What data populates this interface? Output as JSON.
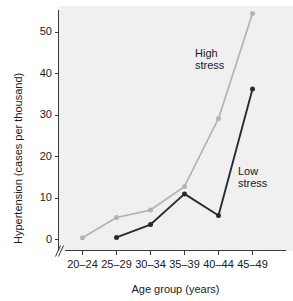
{
  "chart_data": {
    "type": "line",
    "title": "",
    "xlabel": "Age group (years)",
    "ylabel": "Hypertension (cases per thousand)",
    "categories": [
      "20–24",
      "25–29",
      "30–34",
      "35–39",
      "40–44",
      "45–49"
    ],
    "yticks": [
      0,
      10,
      20,
      30,
      40,
      50
    ],
    "ylim": [
      0,
      55
    ],
    "grid": false,
    "legend_position": "inline-annotations",
    "axis_break_x": true,
    "plot_background": "#f0f0f0",
    "series": [
      {
        "name": "High stress",
        "color": "#b3b3b3",
        "marker": "circle",
        "annotation": "High\nstress",
        "annotation_line1": "High",
        "annotation_line2": "stress",
        "values": [
          0.4,
          5.3,
          7.1,
          12.8,
          29.2,
          54.5
        ]
      },
      {
        "name": "Low stress",
        "color": "#2b2b2b",
        "marker": "circle",
        "annotation": "Low\nstress",
        "annotation_line1": "Low",
        "annotation_line2": "stress",
        "values": [
          null,
          0.5,
          3.6,
          11.0,
          5.8,
          36.3
        ]
      }
    ]
  },
  "axis": {
    "y_label": "Hypertension (cases per thousand)",
    "x_label": "Age group (years)",
    "y_tick_labels": [
      "0",
      "10",
      "20",
      "30",
      "40",
      "50"
    ],
    "x_tick_labels": [
      "20–24",
      "25–29",
      "30–34",
      "35–39",
      "40–44",
      "45–49"
    ]
  },
  "annotations": {
    "high_stress_line1": "High",
    "high_stress_line2": "stress",
    "low_stress_line1": "Low",
    "low_stress_line2": "stress"
  }
}
